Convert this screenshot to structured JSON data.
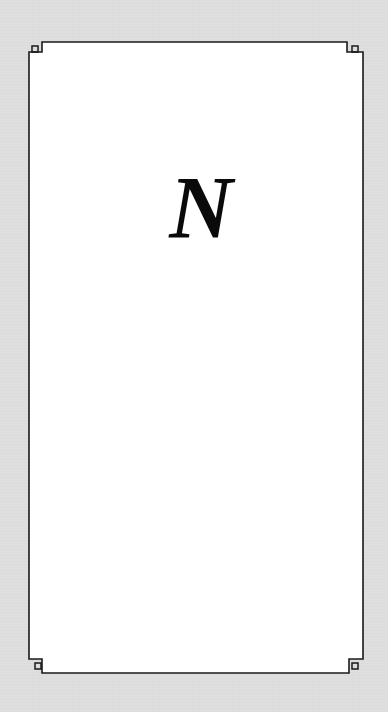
{
  "card": {
    "letter": "N",
    "background_color": "#dedede",
    "panel_color": "#ffffff",
    "border_color": "#1a1a1a"
  }
}
